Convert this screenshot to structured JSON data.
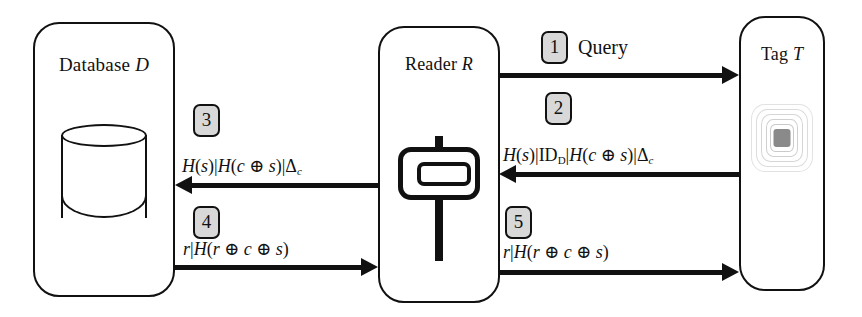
{
  "diagram": {
    "background_color": "#ffffff",
    "line_color": "#111111",
    "badge_fill_color": "#d8d8d8",
    "tag_icon_color": "#d9d9d9",
    "tag_chip_color": "#8a8a8a"
  },
  "entities": [
    {
      "id": "database",
      "label": "Database ",
      "italic": "D"
    },
    {
      "id": "reader",
      "label": "Reader ",
      "italic": "R"
    },
    {
      "id": "tag",
      "label": "Tag ",
      "italic": "T"
    }
  ],
  "icons": {
    "database": "database-cylinder-icon",
    "reader": "rfid-reader-icon",
    "tag": "rfid-tag-antenna-icon"
  },
  "messages": [
    {
      "step": "1",
      "from": "reader",
      "to": "tag",
      "direction": "right",
      "label_plain": "Query"
    },
    {
      "step": "2",
      "from": "tag",
      "to": "reader",
      "direction": "left",
      "label_text": "H(s)|ID_D|H(c ⊕ s)|Δ_c"
    },
    {
      "step": "3",
      "from": "reader",
      "to": "database",
      "direction": "left",
      "label_text": "H(s)|H(c ⊕ s)|Δ_c"
    },
    {
      "step": "4",
      "from": "database",
      "to": "reader",
      "direction": "right",
      "label_text": "r|H(r ⊕ c ⊕ s)"
    },
    {
      "step": "5",
      "from": "reader",
      "to": "tag",
      "direction": "right",
      "label_text": "r|H(r ⊕ c ⊕ s)"
    }
  ]
}
